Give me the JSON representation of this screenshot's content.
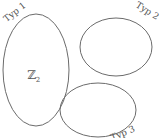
{
  "diagram": {
    "sets": [
      {
        "id": "typ1",
        "label": "Typ 1",
        "content": "ℤ",
        "content_sub": "2"
      },
      {
        "id": "typ2",
        "label": "Typ 2",
        "content": ""
      },
      {
        "id": "typ3",
        "label": "Typ 3",
        "content": ""
      }
    ],
    "colors": {
      "stroke": "#6b6b6b",
      "text": "#555555",
      "background": "#ffffff"
    }
  }
}
